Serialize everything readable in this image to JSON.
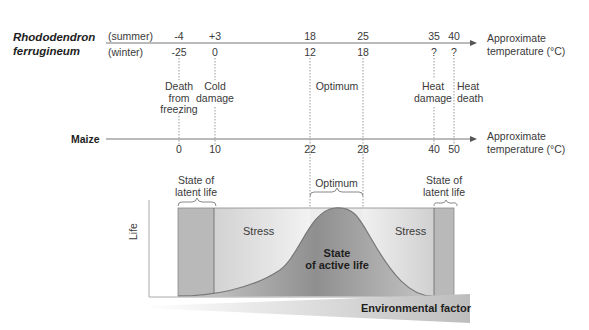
{
  "rhododendron": {
    "species_line1": "Rhododendron",
    "species_line2": "ferrugineum",
    "summer_label": "(summer)",
    "winter_label": "(winter)",
    "summer_values": [
      "-4",
      "+3",
      "18",
      "25",
      "35",
      "40"
    ],
    "winter_values": [
      "-25",
      "0",
      "12",
      "18",
      "?",
      "?"
    ],
    "axis_label_line1": "Approximate",
    "axis_label_line2": "temperature (°C)"
  },
  "zones": {
    "death_freezing": [
      "Death",
      "from",
      "freezing"
    ],
    "cold_damage": [
      "Cold",
      "damage"
    ],
    "optimum": "Optimum",
    "heat_damage": [
      "Heat",
      "damage"
    ],
    "heat_death": [
      "Heat",
      "death"
    ]
  },
  "maize": {
    "species": "Maize",
    "values": [
      "0",
      "10",
      "22",
      "28",
      "40",
      "50"
    ],
    "axis_label_line1": "Approximate",
    "axis_label_line2": "temperature (°C)"
  },
  "curve_panel": {
    "latent_left": [
      "State of",
      "latent life"
    ],
    "optimum": "Optimum",
    "latent_right": [
      "State of",
      "latent life"
    ],
    "stress_left": "Stress",
    "stress_right": "Stress",
    "active": [
      "State",
      "of active life"
    ],
    "y_label": "Life",
    "x_label": "Environmental factor"
  },
  "colors": {
    "axis": "#666666",
    "latent_fill": "#b9b9b9",
    "stress_fill": "#e4e4e4",
    "curve_fill": "#a8a8a8",
    "factor_bar": "#c8c8c8"
  }
}
